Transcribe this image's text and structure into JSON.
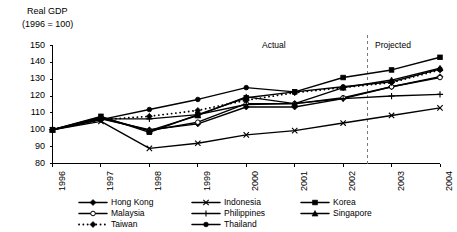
{
  "chart_data": {
    "type": "line",
    "title": "Real GDP",
    "subtitle": "(1996 = 100)",
    "xlabel": "",
    "ylabel": "",
    "categories": [
      "1996",
      "1997",
      "1998",
      "1999",
      "2000",
      "2001",
      "2002",
      "2003",
      "2004"
    ],
    "x": [
      1996,
      1997,
      1998,
      1999,
      2000,
      2001,
      2002,
      2003,
      2004
    ],
    "ylim": [
      80,
      150
    ],
    "yticks": [
      80,
      90,
      100,
      110,
      120,
      130,
      140,
      150
    ],
    "grid": false,
    "legend_position": "bottom",
    "annotations": [
      {
        "text": "Actual",
        "x": 2001.0,
        "y": 147
      },
      {
        "text": "Projected",
        "x": 2003.1,
        "y": 147
      },
      {
        "text": "divider",
        "type": "vertical-dashed-line",
        "x": 2002.5
      }
    ],
    "series": [
      {
        "name": "Hong Kong",
        "marker": "diamond-filled",
        "line": "solid",
        "values": [
          100.0,
          106.5,
          100.0,
          103.5,
          113.5,
          113.5,
          118.5,
          125.5,
          131.5
        ]
      },
      {
        "name": "Indonesia",
        "marker": "x",
        "line": "solid",
        "values": [
          100.0,
          105.0,
          89.0,
          92.0,
          97.0,
          99.5,
          104.0,
          108.5,
          113.0
        ]
      },
      {
        "name": "Korea",
        "marker": "square-filled",
        "line": "solid",
        "values": [
          100.0,
          108.0,
          98.5,
          109.0,
          119.0,
          122.5,
          131.0,
          135.5,
          143.0
        ]
      },
      {
        "name": "Malaysia",
        "marker": "circle-open",
        "line": "solid",
        "values": [
          100.0,
          107.0,
          99.5,
          104.5,
          115.5,
          115.5,
          119.0,
          125.5,
          131.0
        ]
      },
      {
        "name": "Philippines",
        "marker": "plus",
        "line": "solid",
        "values": [
          100.0,
          106.5,
          106.5,
          109.0,
          115.0,
          115.5,
          118.5,
          120.0,
          121.0
        ]
      },
      {
        "name": "Singapore",
        "marker": "triangle-filled",
        "line": "solid",
        "values": [
          100.0,
          107.5,
          99.5,
          108.5,
          119.5,
          115.5,
          125.0,
          129.5,
          136.5
        ]
      },
      {
        "name": "Taiwan",
        "marker": "diamond-filled",
        "line": "dotted",
        "values": [
          100.0,
          106.0,
          108.0,
          111.5,
          117.5,
          122.0,
          125.0,
          128.0,
          135.5
        ]
      },
      {
        "name": "Thailand",
        "marker": "circle-filled",
        "line": "solid",
        "values": [
          100.0,
          106.0,
          112.0,
          118.0,
          125.0,
          122.5,
          125.5,
          128.5,
          136.0
        ]
      }
    ]
  },
  "title": {
    "line1": "Real GDP",
    "line2": "(1996 = 100)"
  },
  "axis": {
    "y_ticks": [
      "150",
      "140",
      "130",
      "120",
      "110",
      "100",
      "90",
      "80"
    ],
    "x_ticks": [
      "1996",
      "1997",
      "1998",
      "1999",
      "2000",
      "2001",
      "2002",
      "2003",
      "2004"
    ]
  },
  "annotations": {
    "actual": "Actual",
    "projected": "Projected"
  },
  "legend": {
    "items": [
      {
        "label": "Hong Kong",
        "marker": "diamond-filled",
        "line": "solid",
        "col": 0,
        "row": 0
      },
      {
        "label": "Malaysia",
        "marker": "circle-open",
        "line": "solid",
        "col": 0,
        "row": 1
      },
      {
        "label": "Taiwan",
        "marker": "diamond-filled",
        "line": "dotted",
        "col": 0,
        "row": 2
      },
      {
        "label": "Indonesia",
        "marker": "x",
        "line": "solid",
        "col": 1,
        "row": 0
      },
      {
        "label": "Philippines",
        "marker": "plus",
        "line": "solid",
        "col": 1,
        "row": 1
      },
      {
        "label": "Thailand",
        "marker": "circle-filled",
        "line": "solid",
        "col": 1,
        "row": 2
      },
      {
        "label": "Korea",
        "marker": "square-filled",
        "line": "solid",
        "col": 2,
        "row": 0
      },
      {
        "label": "Singapore",
        "marker": "triangle-filled",
        "line": "solid",
        "col": 2,
        "row": 1
      }
    ]
  },
  "colors": {
    "ink": "#000000",
    "background": "#ffffff",
    "divider": "#888888"
  }
}
